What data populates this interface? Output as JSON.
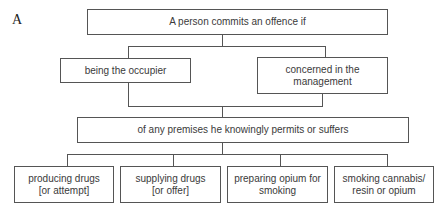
{
  "panel_label": "A",
  "root": {
    "text": "A person commits an offence if"
  },
  "roles": [
    {
      "text": "being the occupier"
    },
    {
      "text": "concerned in the management"
    }
  ],
  "condition": {
    "text": "of any premises he knowingly permits or suffers"
  },
  "activities": [
    {
      "line1": "producing drugs",
      "line2": "[or attempt]"
    },
    {
      "line1": "supplying drugs",
      "line2": "[or offer]"
    },
    {
      "line1": "preparing opium for",
      "line2": "smoking"
    },
    {
      "line1": "smoking cannabis/",
      "line2": "resin or opium"
    }
  ]
}
